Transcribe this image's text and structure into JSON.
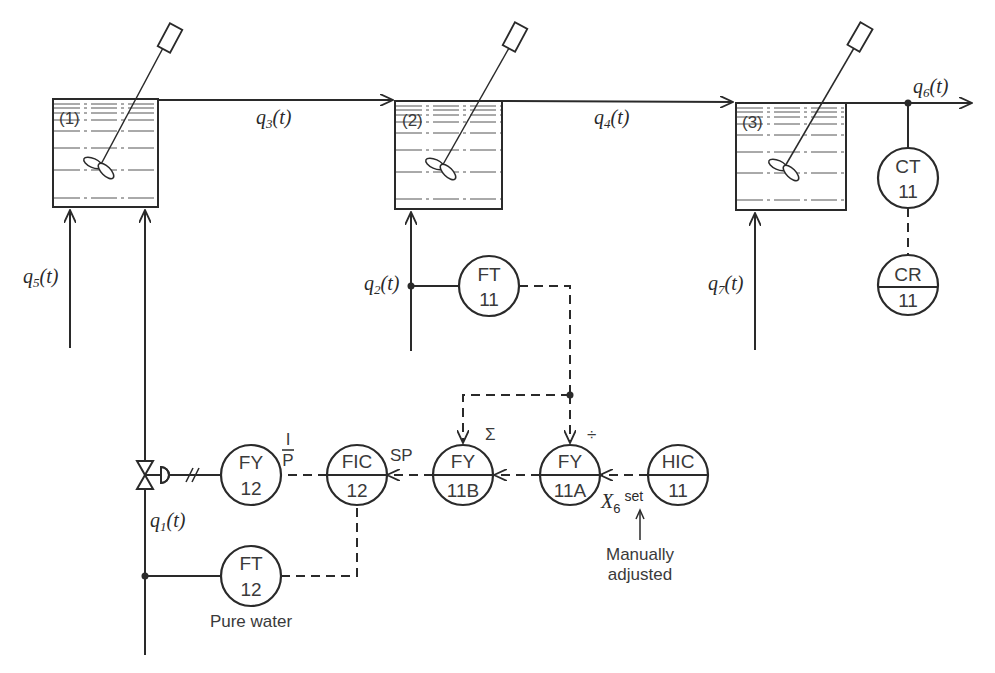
{
  "diagram": {
    "tanks": [
      {
        "id": "tank-1",
        "label": "(1)"
      },
      {
        "id": "tank-2",
        "label": "(2)"
      },
      {
        "id": "tank-3",
        "label": "(3)"
      }
    ],
    "streams": {
      "q1": {
        "base": "q",
        "sub": "1",
        "tail": "(t)"
      },
      "q2": {
        "base": "q",
        "sub": "2",
        "tail": "(t)"
      },
      "q3": {
        "base": "q",
        "sub": "3",
        "tail": "(t)"
      },
      "q4": {
        "base": "q",
        "sub": "4",
        "tail": "(t)"
      },
      "q5": {
        "base": "q",
        "sub": "5",
        "tail": "(t)"
      },
      "q6": {
        "base": "q",
        "sub": "6",
        "tail": "(t)"
      },
      "q7": {
        "base": "q",
        "sub": "7",
        "tail": "(t)"
      }
    },
    "instruments": {
      "ct11": {
        "top": "CT",
        "bottom": "11",
        "shared": false
      },
      "cr11": {
        "top": "CR",
        "bottom": "11",
        "shared": true
      },
      "ft11": {
        "top": "FT",
        "bottom": "11",
        "shared": false
      },
      "fy12": {
        "top": "FY",
        "bottom": "12",
        "shared": false
      },
      "fic12": {
        "top": "FIC",
        "bottom": "12",
        "shared": true
      },
      "fy11b": {
        "top": "FY",
        "bottom": "11B",
        "shared": true
      },
      "fy11a": {
        "top": "FY",
        "bottom": "11A",
        "shared": true
      },
      "hic11": {
        "top": "HIC",
        "bottom": "11",
        "shared": true
      },
      "ft12": {
        "top": "FT",
        "bottom": "12",
        "shared": false
      }
    },
    "annotations": {
      "ip_top": "I",
      "ip_bottom": "P",
      "sp": "SP",
      "sum_symbol": "Σ",
      "divide_symbol": "÷",
      "x6_base": "X",
      "x6_sub": "6",
      "x6_sup": "set",
      "manual_line1": "Manually",
      "manual_line2": "adjusted",
      "pure_water": "Pure water"
    }
  }
}
